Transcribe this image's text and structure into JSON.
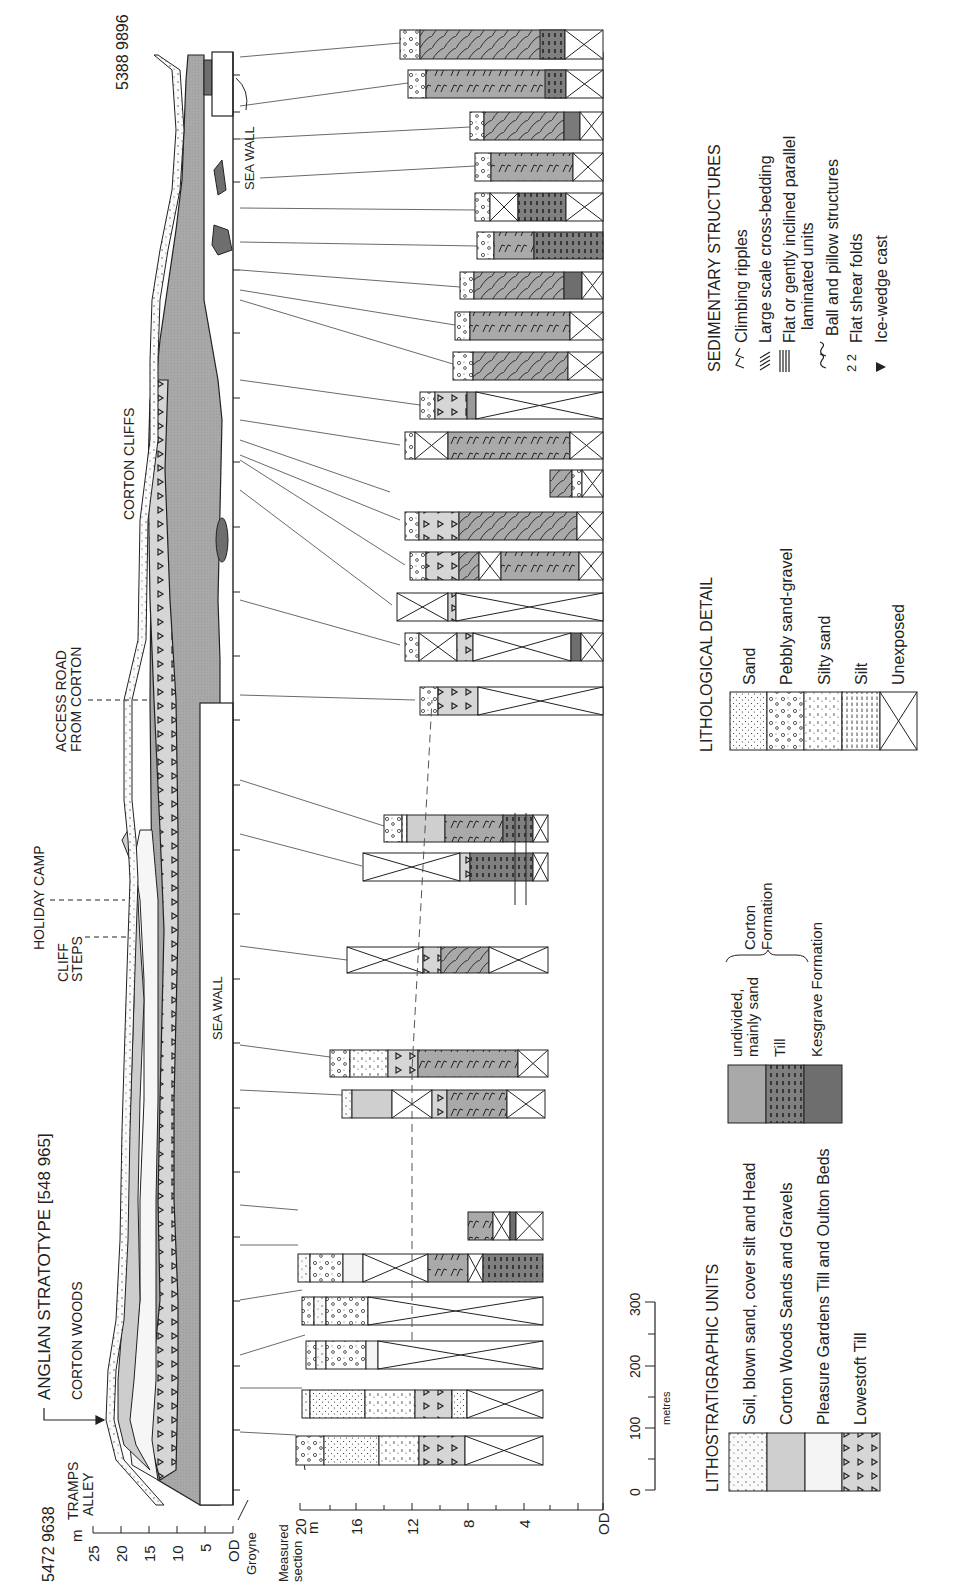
{
  "title": "ANGLIAN STRATOTYPE [548 965]",
  "grid_refs": {
    "south": "5472 9638",
    "north": "5388 9896"
  },
  "place_labels": [
    {
      "id": "tramps-alley",
      "lines": [
        "TRAMPS",
        "ALLEY"
      ]
    },
    {
      "id": "corton-woods",
      "lines": [
        "CORTON WOODS"
      ]
    },
    {
      "id": "cliff-steps",
      "lines": [
        "CLIFF",
        "STEPS"
      ]
    },
    {
      "id": "holiday-camp",
      "lines": [
        "HOLIDAY CAMP"
      ]
    },
    {
      "id": "access-road",
      "lines": [
        "ACCESS ROAD",
        "FROM CORTON"
      ]
    },
    {
      "id": "corton-cliffs",
      "lines": [
        "CORTON CLIFFS"
      ]
    }
  ],
  "structures": {
    "sea_wall_south": "SEA WALL",
    "sea_wall_north": "SEA WALL",
    "groyne": "Groyne",
    "measured_section": [
      "Measured",
      "section"
    ]
  },
  "profile_axis": {
    "unit": "m",
    "ticks": [
      "25",
      "20",
      "15",
      "10",
      "5",
      "OD"
    ]
  },
  "section_axis": {
    "unit": "m",
    "ticks": [
      "20",
      "16",
      "12",
      "8",
      "4",
      "OD"
    ]
  },
  "scale_bar": {
    "unit": "metres",
    "ticks": [
      "0",
      "100",
      "200",
      "300"
    ]
  },
  "legend_lithostratigraphic": {
    "title": "LITHOSTRATIGRAPHIC UNITS",
    "items": [
      "Soil, blown sand, cover silt and Head",
      "Corton Woods Sands and Gravels",
      "Pleasure Gardens Till and Oulton Beds",
      "Lowestoft Till"
    ]
  },
  "legend_corton": {
    "items": [
      "undivided, mainly sand",
      "Till",
      "Kesgrave Formation"
    ],
    "group_label": [
      "Corton",
      "Formation"
    ]
  },
  "legend_lithological": {
    "title": "LITHOLOGICAL DETAIL",
    "items": [
      "Sand",
      "Pebbly sand-gravel",
      "Silty sand",
      "Silt",
      "Unexposed"
    ]
  },
  "legend_sedimentary": {
    "title": "SEDIMENTARY STRUCTURES",
    "items": [
      {
        "symbol": "climbing-ripples",
        "label": "Climbing ripples"
      },
      {
        "symbol": "cross-bedding",
        "label": "Large scale cross-bedding"
      },
      {
        "symbol": "parallel-lamination",
        "label": "Flat or gently inclined parallel",
        "label2": "laminated units"
      },
      {
        "symbol": "ball-pillow",
        "label": "Ball and pillow structures"
      },
      {
        "symbol": "shear-folds",
        "label": "Flat shear folds"
      },
      {
        "symbol": "ice-wedge",
        "label": "Ice-wedge cast"
      }
    ]
  },
  "colors": {
    "line": "#222222",
    "corton_sand": "#a9a9a9",
    "corton_till": "#8a8a8a",
    "kesgrave": "#6e6e6e",
    "corton_woods": "#cfcfcf",
    "lowestoft_till": "#d8d8d8",
    "pleasure_gardens": "#f4f4f4"
  }
}
